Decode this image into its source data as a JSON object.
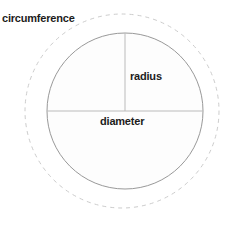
{
  "diagram": {
    "labels": {
      "circumference": "circumference",
      "radius": "radius",
      "diameter": "diameter"
    },
    "colors": {
      "circle_stroke": "#999999",
      "dashed_stroke": "#cccccc",
      "line_stroke": "#bbbbbb",
      "circle_fill": "#fdfdfd",
      "text": "#1c1c1c",
      "background": "#ffffff"
    },
    "geometry": {
      "circle_center_x": 125,
      "circle_center_y": 111,
      "circle_radius": 78,
      "dashed_center_x": 122,
      "dashed_center_y": 111,
      "dashed_radius": 97,
      "radius_line_x": 125,
      "radius_line_top_y": 33,
      "radius_line_bottom_y": 111,
      "diameter_line_y": 111,
      "diameter_line_left_x": 47,
      "diameter_line_right_x": 203,
      "dash_pattern": "4 4"
    }
  }
}
